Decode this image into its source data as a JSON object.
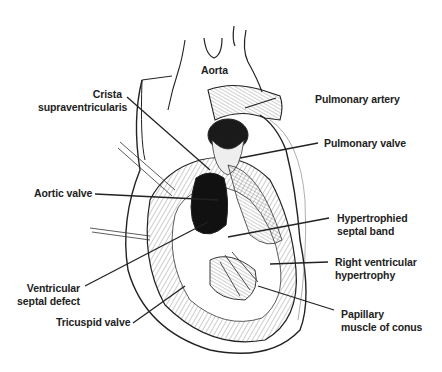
{
  "figure": {
    "labels": {
      "aorta": "Aorta",
      "crista_1": "Crista",
      "crista_2": "supraventricularis",
      "pulmonary_artery": "Pulmonary artery",
      "pulmonary_valve": "Pulmonary valve",
      "aortic_valve": "Aortic valve",
      "hypertrophied_1": "Hypertrophied",
      "hypertrophied_2": "septal band",
      "rv_hypertrophy_1": "Right ventricular",
      "rv_hypertrophy_2": "hypertrophy",
      "vsd_1": "Ventricular",
      "vsd_2": "septal defect",
      "tricuspid_valve": "Tricuspid valve",
      "papillary_1": "Papillary",
      "papillary_2": "muscle of conus"
    },
    "colors": {
      "ink": "#222222",
      "background": "#ffffff",
      "shadow": "#111111"
    }
  }
}
